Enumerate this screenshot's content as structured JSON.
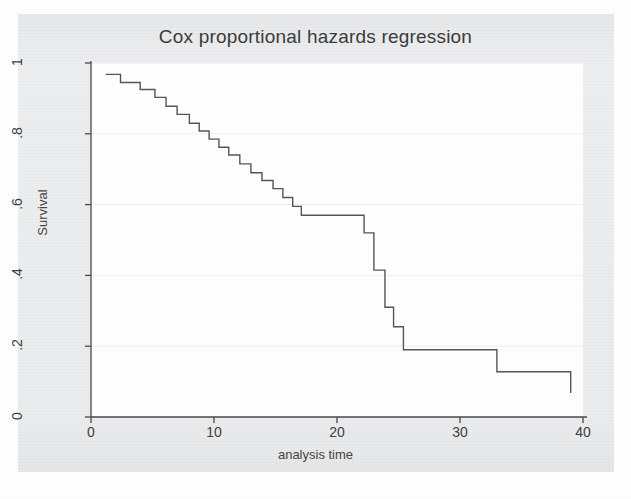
{
  "figure": {
    "background_color": "#ecedee",
    "panel_color": "#ffffff",
    "line_color": "#55565a",
    "axis_color": "#4a4a4a",
    "grid_color": "#f2eef0",
    "text_color": "#3c3c3c"
  },
  "chart_data": {
    "type": "line",
    "subtype": "step-function-survival-curve",
    "title": "Cox proportional hazards regression",
    "xlabel": "analysis time",
    "ylabel": "Survival",
    "xlim": [
      0,
      40
    ],
    "ylim": [
      0,
      1
    ],
    "xticks": [
      0,
      10,
      20,
      30,
      40
    ],
    "xtick_labels": [
      "0",
      "10",
      "20",
      "30",
      "40"
    ],
    "yticks": [
      0,
      0.2,
      0.4,
      0.6,
      0.8,
      1
    ],
    "ytick_labels": [
      "0",
      ".2",
      ".4",
      ".6",
      ".8",
      "1"
    ],
    "grid": "horizontal-faint",
    "legend": "none",
    "series": [
      {
        "name": "Survival",
        "step": "post",
        "x": [
          1.2,
          2.4,
          4.0,
          5.2,
          6.1,
          7.0,
          8.0,
          8.8,
          9.6,
          10.4,
          11.2,
          12.1,
          13.0,
          13.9,
          14.8,
          15.6,
          16.4,
          17.1,
          22.2,
          23.0,
          23.9,
          24.6,
          25.4,
          28.2,
          33.0,
          39.0
        ],
        "y": [
          0.968,
          0.945,
          0.925,
          0.903,
          0.878,
          0.855,
          0.83,
          0.808,
          0.785,
          0.762,
          0.74,
          0.715,
          0.69,
          0.668,
          0.645,
          0.62,
          0.595,
          0.57,
          0.52,
          0.415,
          0.31,
          0.255,
          0.19,
          0.19,
          0.128,
          0.068
        ],
        "description": "Monotone decreasing Kaplan-Meier-style step curve starting near S=0.97 at t~1 and ending at S~0.07 at t~39, with a long plateau at S=0.52 from t~17 to t~22 and a steep drop between t~22 and t~25."
      }
    ]
  }
}
